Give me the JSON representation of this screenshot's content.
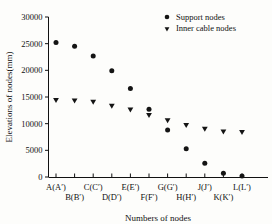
{
  "chart_data": {
    "type": "scatter",
    "title": "",
    "xlabel": "Numbers of nodes",
    "ylabel": "Elevations of nodes(mm)",
    "categories": [
      "A(A′)",
      "B(B′)",
      "C(C′)",
      "D(D′)",
      "E(E′)",
      "F(F′)",
      "G(G′)",
      "H(H′)",
      "J(J′)",
      "K(K′)",
      "L(L′)"
    ],
    "ylim": [
      0,
      30000
    ],
    "yticks": [
      0,
      5000,
      10000,
      15000,
      20000,
      25000,
      30000
    ],
    "ytick_labels": [
      "0",
      "5000",
      "10000",
      "15000",
      "20000",
      "25000",
      "30000"
    ],
    "grid": false,
    "legend_position": "top-right",
    "series": [
      {
        "name": "Support nodes",
        "marker": "circle",
        "color": "#141414",
        "values": [
          25200,
          24500,
          22700,
          19900,
          16600,
          12700,
          8800,
          5300,
          2600,
          700,
          200
        ]
      },
      {
        "name": "Inner cable nodes",
        "marker": "triangle-down",
        "color": "#141414",
        "values": [
          14400,
          14300,
          14050,
          13300,
          12600,
          11600,
          10600,
          9700,
          9000,
          8500,
          8400
        ]
      }
    ]
  },
  "legend": {
    "entries": [
      {
        "label": "Support nodes",
        "marker": "circle"
      },
      {
        "label": "Inner cable nodes",
        "marker": "triangle-down"
      }
    ]
  },
  "xaxis": {
    "title": "Numbers of nodes",
    "row_top": [
      "A(A′)",
      "C(C′)",
      "E(E′)",
      "G(G′)",
      "J(J′)",
      "L(L′)"
    ],
    "row_bottom": [
      "B(B′)",
      "D(D′)",
      "F(F′)",
      "H(H′)",
      "K(K′)"
    ]
  },
  "yaxis": {
    "title": "Elevations of nodes(mm)"
  }
}
